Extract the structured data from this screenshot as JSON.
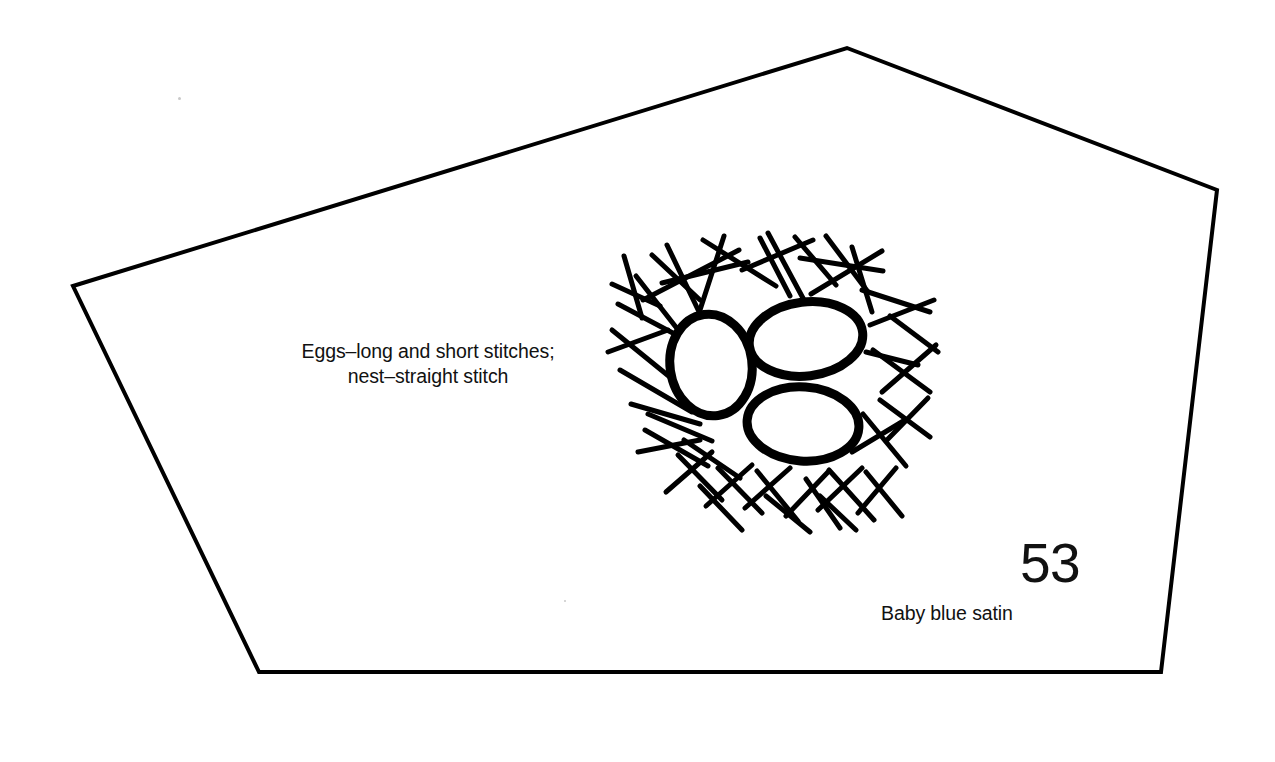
{
  "document": {
    "type": "embroidery-pattern-piece",
    "background_color": "#ffffff",
    "ink_color": "#000000",
    "width": 1275,
    "height": 762
  },
  "pattern_piece": {
    "shape_name": "pentagon-outline",
    "stroke_color": "#000000",
    "stroke_width": 4,
    "vertices": [
      [
        73,
        286
      ],
      [
        847,
        48
      ],
      [
        1217,
        190
      ],
      [
        1161,
        672
      ],
      [
        259,
        672
      ]
    ]
  },
  "labels": {
    "stitch_note": "Eggs–long and short stitches;\nnest–straight stitch",
    "piece_number": "53",
    "fabric_note": "Baby blue satin"
  },
  "motif": {
    "name": "birds-nest-with-three-eggs",
    "center": [
      782,
      378
    ],
    "eggs": [
      {
        "name": "egg-left",
        "cx": 711,
        "cy": 365,
        "rx": 41,
        "ry": 51,
        "rotation": -8,
        "stroke_width": 9
      },
      {
        "name": "egg-top-right",
        "cx": 806,
        "cy": 339,
        "rx": 57,
        "ry": 37,
        "rotation": -7,
        "stroke_width": 9
      },
      {
        "name": "egg-bottom-right",
        "cx": 803,
        "cy": 424,
        "rx": 56,
        "ry": 37,
        "rotation": 4,
        "stroke_width": 9
      }
    ],
    "nest_sticks": [
      [
        643,
        300,
        739,
        250
      ],
      [
        667,
        245,
        702,
        318
      ],
      [
        724,
        236,
        700,
        310
      ],
      [
        662,
        283,
        748,
        262
      ],
      [
        703,
        240,
        776,
        286
      ],
      [
        742,
        270,
        813,
        240
      ],
      [
        768,
        233,
        804,
        300
      ],
      [
        795,
        237,
        836,
        285
      ],
      [
        800,
        258,
        883,
        271
      ],
      [
        811,
        294,
        882,
        251
      ],
      [
        852,
        247,
        872,
        312
      ],
      [
        862,
        290,
        930,
        312
      ],
      [
        870,
        325,
        934,
        300
      ],
      [
        873,
        350,
        930,
        392
      ],
      [
        882,
        392,
        936,
        345
      ],
      [
        866,
        352,
        918,
        365
      ],
      [
        880,
        400,
        930,
        437
      ],
      [
        886,
        441,
        928,
        398
      ],
      [
        863,
        414,
        906,
        466
      ],
      [
        852,
        452,
        905,
        420
      ],
      [
        866,
        472,
        902,
        516
      ],
      [
        858,
        513,
        896,
        468
      ],
      [
        829,
        470,
        874,
        520
      ],
      [
        818,
        510,
        862,
        468
      ],
      [
        806,
        479,
        840,
        528
      ],
      [
        786,
        516,
        828,
        472
      ],
      [
        757,
        471,
        798,
        521
      ],
      [
        745,
        508,
        790,
        468
      ],
      [
        718,
        468,
        762,
        513
      ],
      [
        706,
        506,
        752,
        465
      ],
      [
        678,
        455,
        722,
        500
      ],
      [
        666,
        492,
        712,
        452
      ],
      [
        645,
        430,
        708,
        466
      ],
      [
        638,
        452,
        700,
        440
      ],
      [
        648,
        414,
        712,
        441
      ],
      [
        631,
        404,
        700,
        424
      ],
      [
        620,
        370,
        692,
        412
      ],
      [
        612,
        330,
        676,
        382
      ],
      [
        618,
        304,
        686,
        340
      ],
      [
        636,
        276,
        686,
        340
      ],
      [
        652,
        255,
        700,
        300
      ],
      [
        608,
        352,
        668,
        330
      ],
      [
        624,
        256,
        642,
        318
      ],
      [
        612,
        284,
        660,
        306
      ],
      [
        760,
        238,
        790,
        296
      ],
      [
        826,
        236,
        868,
        292
      ],
      [
        890,
        316,
        938,
        352
      ],
      [
        700,
        486,
        742,
        530
      ],
      [
        766,
        496,
        810,
        532
      ],
      [
        820,
        496,
        856,
        530
      ],
      [
        684,
        440,
        740,
        478
      ]
    ]
  },
  "artifacts": [
    {
      "name": "scan-speck-upper-left",
      "x": 178,
      "y": 97,
      "size": 3
    },
    {
      "name": "scan-speck-lower-center",
      "x": 564,
      "y": 600,
      "size": 2
    }
  ]
}
